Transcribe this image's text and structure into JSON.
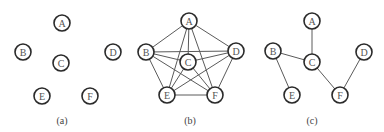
{
  "diagram": {
    "node_radius": 8,
    "panels": [
      {
        "id": "a",
        "caption": "(a)",
        "caption_pos": [
          62,
          120
        ],
        "nodes": [
          {
            "label": "A",
            "x": 62,
            "y": 23
          },
          {
            "label": "B",
            "x": 23,
            "y": 52
          },
          {
            "label": "C",
            "x": 61,
            "y": 63
          },
          {
            "label": "D",
            "x": 113,
            "y": 52
          },
          {
            "label": "E",
            "x": 42,
            "y": 96
          },
          {
            "label": "F",
            "x": 90,
            "y": 96
          }
        ],
        "edges": []
      },
      {
        "id": "b",
        "caption": "(b)",
        "caption_pos": [
          190,
          120
        ],
        "nodes": [
          {
            "label": "A",
            "x": 189,
            "y": 21
          },
          {
            "label": "B",
            "x": 146,
            "y": 52
          },
          {
            "label": "C",
            "x": 188,
            "y": 62
          },
          {
            "label": "D",
            "x": 236,
            "y": 51
          },
          {
            "label": "E",
            "x": 167,
            "y": 95
          },
          {
            "label": "F",
            "x": 215,
            "y": 95
          }
        ],
        "edges": [
          [
            "A",
            "B"
          ],
          [
            "A",
            "C"
          ],
          [
            "A",
            "D"
          ],
          [
            "A",
            "E"
          ],
          [
            "A",
            "F"
          ],
          [
            "B",
            "C"
          ],
          [
            "B",
            "D"
          ],
          [
            "B",
            "E"
          ],
          [
            "B",
            "F"
          ],
          [
            "C",
            "D"
          ],
          [
            "C",
            "E"
          ],
          [
            "C",
            "F"
          ],
          [
            "D",
            "E"
          ],
          [
            "D",
            "F"
          ],
          [
            "E",
            "F"
          ]
        ]
      },
      {
        "id": "c",
        "caption": "(c)",
        "caption_pos": [
          312,
          120
        ],
        "nodes": [
          {
            "label": "A",
            "x": 312,
            "y": 21
          },
          {
            "label": "B",
            "x": 273,
            "y": 51
          },
          {
            "label": "C",
            "x": 312,
            "y": 62
          },
          {
            "label": "D",
            "x": 364,
            "y": 52
          },
          {
            "label": "E",
            "x": 292,
            "y": 95
          },
          {
            "label": "F",
            "x": 340,
            "y": 95
          }
        ],
        "edges": [
          [
            "A",
            "C"
          ],
          [
            "B",
            "C"
          ],
          [
            "B",
            "E"
          ],
          [
            "C",
            "F"
          ],
          [
            "F",
            "D"
          ]
        ]
      }
    ]
  }
}
